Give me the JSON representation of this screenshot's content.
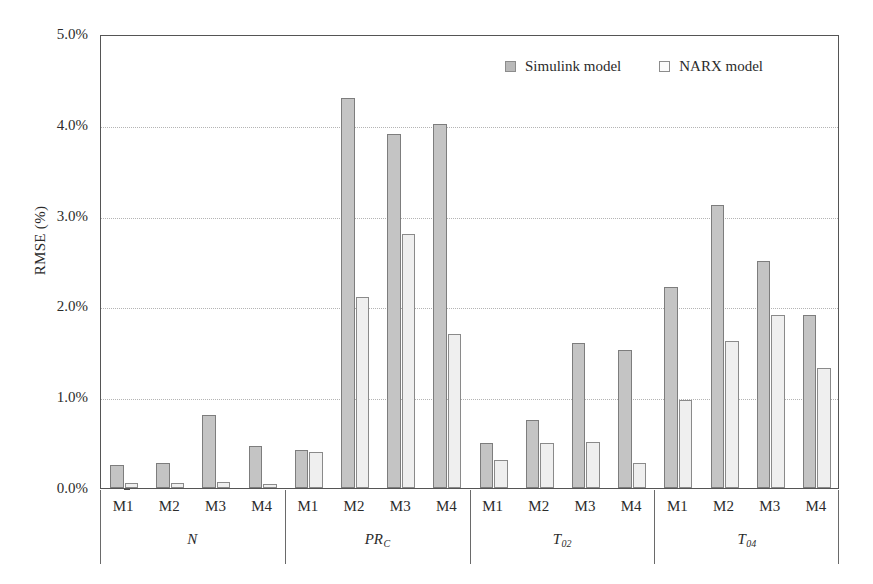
{
  "chart_data": {
    "type": "bar",
    "title": "",
    "xlabel": "",
    "ylabel": "RMSE (%)",
    "ylim": [
      0,
      5
    ],
    "ytick_labels": [
      "0.0%",
      "1.0%",
      "2.0%",
      "3.0%",
      "4.0%",
      "5.0%"
    ],
    "ytick_values": [
      0,
      1,
      2,
      3,
      4,
      5
    ],
    "grid": "horizontal-dotted",
    "legend_position": "top-center",
    "categories": [
      "M1",
      "M2",
      "M3",
      "M4"
    ],
    "groups": [
      {
        "name": "N",
        "name_base": "N",
        "name_sub": "",
        "categories": [
          "M1",
          "M2",
          "M3",
          "M4"
        ],
        "series": [
          {
            "name": "Simulink model",
            "values": [
              0.25,
              0.27,
              0.8,
              0.46
            ]
          },
          {
            "name": "NARX model",
            "values": [
              0.06,
              0.06,
              0.07,
              0.04
            ]
          }
        ]
      },
      {
        "name": "PRC",
        "name_base": "PR",
        "name_sub": "C",
        "categories": [
          "M1",
          "M2",
          "M3",
          "M4"
        ],
        "series": [
          {
            "name": "Simulink model",
            "values": [
              0.42,
              4.3,
              3.9,
              4.01
            ]
          },
          {
            "name": "NARX model",
            "values": [
              0.4,
              2.1,
              2.8,
              1.7
            ]
          }
        ]
      },
      {
        "name": "T02",
        "name_base": "T",
        "name_sub": "02",
        "categories": [
          "M1",
          "M2",
          "M3",
          "M4"
        ],
        "series": [
          {
            "name": "Simulink model",
            "values": [
              0.5,
              0.75,
              1.6,
              1.52
            ]
          },
          {
            "name": "NARX model",
            "values": [
              0.31,
              0.5,
              0.51,
              0.27
            ]
          }
        ]
      },
      {
        "name": "T04",
        "name_base": "T",
        "name_sub": "04",
        "categories": [
          "M1",
          "M2",
          "M3",
          "M4"
        ],
        "series": [
          {
            "name": "Simulink model",
            "values": [
              2.21,
              3.12,
              2.5,
              1.91
            ]
          },
          {
            "name": "NARX model",
            "values": [
              0.97,
              1.62,
              1.9,
              1.32
            ]
          }
        ]
      }
    ],
    "series_names": [
      "Simulink model",
      "NARX model"
    ],
    "colors": {
      "simulink_fill": "#c4c4c4",
      "simulink_border": "#7d7d7d",
      "narx_fill": "#efefef",
      "narx_border": "#8a8a8a",
      "axis": "#555555",
      "gridline": "#b4b4b4"
    }
  },
  "legend": {
    "items": [
      {
        "label": "Simulink model",
        "swatch": "simulink"
      },
      {
        "label": "NARX model",
        "swatch": "narx"
      }
    ]
  },
  "axes": {
    "y_title": "RMSE (%)"
  }
}
